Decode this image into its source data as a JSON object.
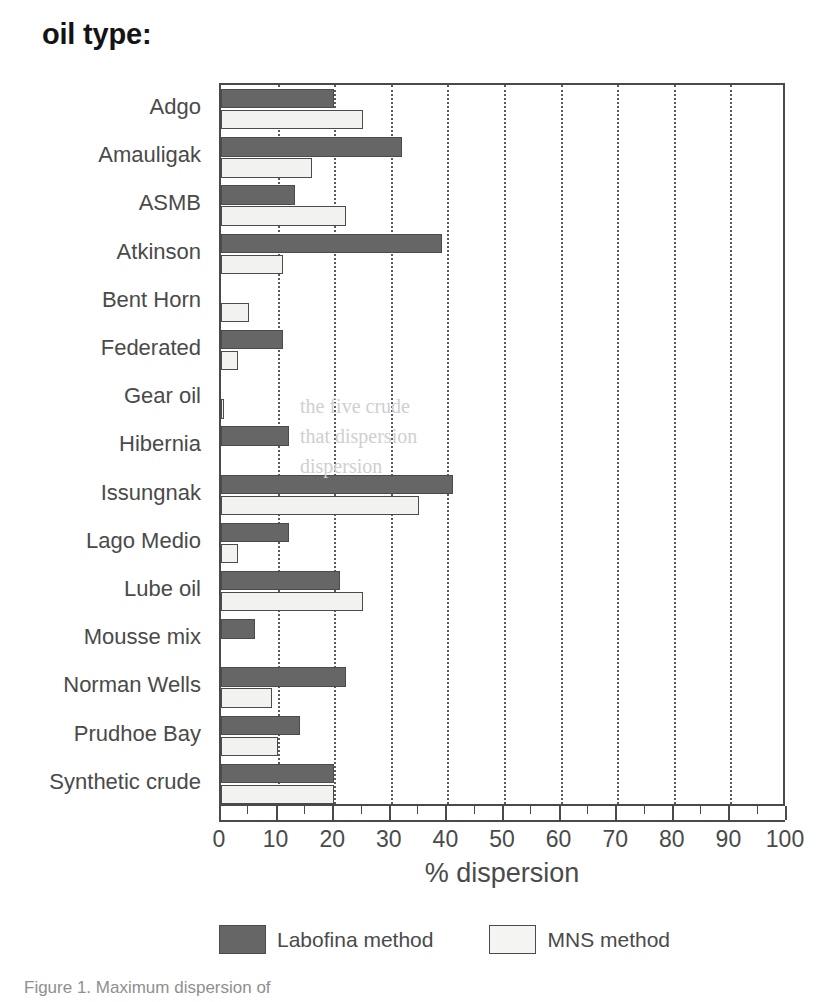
{
  "title": "oil type:",
  "axis": {
    "x_title": "% dispersion",
    "x_ticks": [
      "0",
      "10",
      "20",
      "30",
      "40",
      "50",
      "60",
      "70",
      "80",
      "90",
      "100"
    ]
  },
  "legend": {
    "items": [
      {
        "label": "Labofina method",
        "color": "#666666",
        "key": "labofina"
      },
      {
        "label": "MNS method",
        "color": "#f2f2f0",
        "key": "mns"
      }
    ]
  },
  "caption": "Figure 1.  Maximum dispersion of",
  "bleed_text": [
    {
      "text": "the five crude",
      "x": 300,
      "y": 395
    },
    {
      "text": "that dispersion",
      "x": 300,
      "y": 425
    },
    {
      "text": "dispersion",
      "x": 300,
      "y": 455
    }
  ],
  "chart_data": {
    "type": "bar",
    "orientation": "horizontal",
    "title": "oil type:",
    "xlabel": "% dispersion",
    "ylabel": "oil type:",
    "xlim": [
      0,
      100
    ],
    "grid": true,
    "legend_position": "bottom",
    "categories": [
      "Adgo",
      "Amauligak",
      "ASMB",
      "Atkinson",
      "Bent Horn",
      "Federated",
      "Gear oil",
      "Hibernia",
      "Issungnak",
      "Lago Medio",
      "Lube oil",
      "Mousse mix",
      "Norman Wells",
      "Prudhoe Bay",
      "Synthetic crude"
    ],
    "series": [
      {
        "name": "Labofina method",
        "color": "#666666",
        "values": [
          20,
          32,
          13,
          39,
          0,
          11,
          0,
          12,
          41,
          12,
          21,
          6,
          22,
          14,
          20
        ]
      },
      {
        "name": "MNS method",
        "color": "#f2f2f0",
        "values": [
          25,
          16,
          22,
          11,
          5,
          3,
          0.5,
          0,
          35,
          3,
          25,
          0,
          9,
          10,
          20
        ]
      }
    ]
  }
}
